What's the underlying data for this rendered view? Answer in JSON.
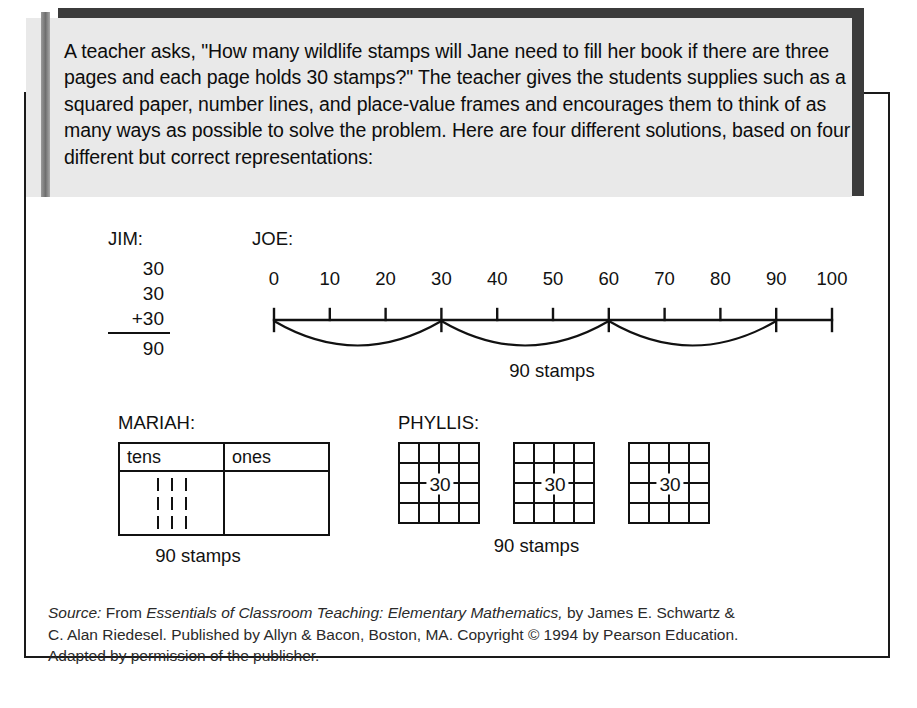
{
  "header": {
    "paragraph": "A teacher asks, \"How many wildlife stamps will Jane need to fill her book if there are three pages and each page holds 30 stamps?\" The teacher gives the students supplies such as a squared paper, number lines, and place-value frames and encourages them to think of as many ways as possible to solve the problem. Here are four different solutions, based on four different but correct representations:"
  },
  "jim": {
    "label": "JIM:",
    "addend1": "30",
    "addend2": "30",
    "addend3": "+30",
    "sum": "90"
  },
  "joe": {
    "label": "JOE:",
    "caption": "90 stamps"
  },
  "mariah": {
    "label": "MARIAH:",
    "col_tens": "tens",
    "col_ones": "ones",
    "tens_tallies": 9,
    "ones_tallies": 0,
    "caption": "90 stamps"
  },
  "phyllis": {
    "label": "PHYLLIS:",
    "grid_value": "30",
    "grid_count": 3,
    "grid_rows": 4,
    "grid_cols": 4,
    "caption": "90 stamps"
  },
  "source": {
    "line1_prefix": "Source:",
    "line1_a": " From ",
    "line1_title": "Essentials of Classroom Teaching: Elementary Mathematics,",
    "line1_b": " by James E. Schwartz &",
    "line2": "C. Alan Riedesel. Published by Allyn & Bacon, Boston, MA. Copyright © 1994 by Pearson Education.",
    "line3": "Adapted by permission of the publisher."
  },
  "chart_data": {
    "type": "line",
    "xlabel": "",
    "ylabel": "",
    "xlim": [
      0,
      100
    ],
    "grid": false,
    "tick_values": [
      0,
      10,
      20,
      30,
      40,
      50,
      60,
      70,
      80,
      90,
      100
    ],
    "tick_labels": [
      "0",
      "10",
      "20",
      "30",
      "40",
      "50",
      "60",
      "70",
      "80",
      "90",
      "100"
    ],
    "major_ticks": [
      0,
      30,
      60,
      90
    ],
    "jumps": [
      {
        "from": 0,
        "to": 30,
        "size": 30
      },
      {
        "from": 30,
        "to": 60,
        "size": 30
      },
      {
        "from": 60,
        "to": 90,
        "size": 30
      }
    ],
    "annotation": "90 stamps"
  },
  "colors": {
    "ink": "#111111",
    "header_background": "#e9e9e9",
    "header_shadow": "#3b3b3b",
    "accent_bar": "#7a7a7a",
    "page_background": "#ffffff"
  }
}
